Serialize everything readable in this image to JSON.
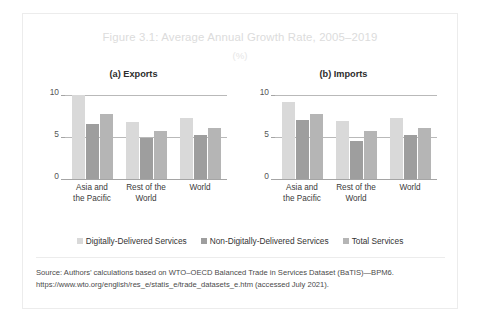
{
  "figure": {
    "title": "Figure 3.1: Average Annual Growth Rate, 2005–2019",
    "subtitle": "(%)",
    "source": "Source: Authors’ calculations based on WTO–OECD Balanced Trade in Services Dataset (BaTIS)—BPM6. https://www.wto.org/english/res_e/statis_e/trade_datasets_e.htm (accessed July 2021)."
  },
  "legend": {
    "items": [
      {
        "label": "Digitally-Delivered Services",
        "color": "#d9d9d9"
      },
      {
        "label": "Non-Digitally-Delivered Services",
        "color": "#9e9e9e"
      },
      {
        "label": "Total Services",
        "color": "#b5b5b5"
      }
    ]
  },
  "chart_data": [
    {
      "type": "bar",
      "title": "(a) Exports",
      "xlabel": "",
      "ylabel": "",
      "ylim": [
        0,
        10
      ],
      "yticks": [
        0,
        5,
        10
      ],
      "ytick_labels": [
        "0",
        "5",
        "10"
      ],
      "grid": true,
      "legend_position": "bottom",
      "categories": [
        "Asia and the Pacific",
        "Rest of the World",
        "World"
      ],
      "category_lines": [
        [
          "Asia and",
          "the Pacific"
        ],
        [
          "Rest of the",
          "World"
        ],
        [
          "World",
          ""
        ]
      ],
      "series": [
        {
          "name": "Digitally-Delivered Services",
          "color": "#d9d9d9",
          "values": [
            10.0,
            6.8,
            7.3
          ]
        },
        {
          "name": "Non-Digitally-Delivered Services",
          "color": "#9e9e9e",
          "values": [
            6.5,
            4.9,
            5.2
          ]
        },
        {
          "name": "Total Services",
          "color": "#b5b5b5",
          "values": [
            7.7,
            5.7,
            6.1
          ]
        }
      ]
    },
    {
      "type": "bar",
      "title": "(b) Imports",
      "xlabel": "",
      "ylabel": "",
      "ylim": [
        0,
        10
      ],
      "yticks": [
        0,
        5,
        10
      ],
      "ytick_labels": [
        "0",
        "5",
        "10"
      ],
      "grid": true,
      "legend_position": "bottom",
      "categories": [
        "Asia and the Pacific",
        "Rest of the World",
        "World"
      ],
      "category_lines": [
        [
          "Asia and",
          "the Pacific"
        ],
        [
          "Rest of the",
          "World"
        ],
        [
          "World",
          ""
        ]
      ],
      "series": [
        {
          "name": "Digitally-Delivered Services",
          "color": "#d9d9d9",
          "values": [
            9.2,
            6.9,
            7.3
          ]
        },
        {
          "name": "Non-Digitally-Delivered Services",
          "color": "#9e9e9e",
          "values": [
            7.0,
            4.5,
            5.2
          ]
        },
        {
          "name": "Total Services",
          "color": "#b5b5b5",
          "values": [
            7.7,
            5.7,
            6.1
          ]
        }
      ]
    }
  ]
}
